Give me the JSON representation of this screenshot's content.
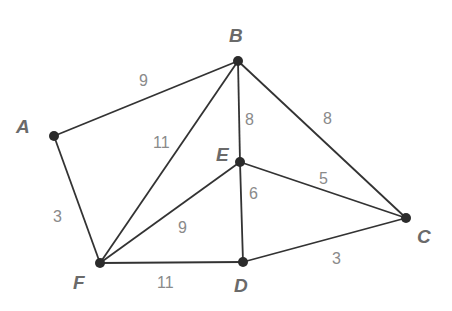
{
  "nodes": [
    {
      "id": "A",
      "label": "A",
      "x": 54,
      "y": 136,
      "lx": 16,
      "ly": 133
    },
    {
      "id": "B",
      "label": "B",
      "x": 238,
      "y": 61,
      "lx": 229,
      "ly": 42
    },
    {
      "id": "C",
      "label": "C",
      "x": 406,
      "y": 218,
      "lx": 417,
      "ly": 243
    },
    {
      "id": "D",
      "label": "D",
      "x": 243,
      "y": 262,
      "lx": 234,
      "ly": 292
    },
    {
      "id": "E",
      "label": "E",
      "x": 240,
      "y": 162,
      "lx": 216,
      "ly": 161
    },
    {
      "id": "F",
      "label": "F",
      "x": 100,
      "y": 263,
      "lx": 73,
      "ly": 289
    }
  ],
  "edges": [
    {
      "from": "A",
      "to": "B",
      "weight": "9",
      "wx": 139,
      "wy": 86
    },
    {
      "from": "A",
      "to": "F",
      "weight": "3",
      "wx": 53,
      "wy": 222
    },
    {
      "from": "F",
      "to": "B",
      "weight": "11",
      "wx": 153,
      "wy": 148
    },
    {
      "from": "B",
      "to": "E",
      "weight": "8",
      "wx": 245,
      "wy": 125
    },
    {
      "from": "B",
      "to": "C",
      "weight": "8",
      "wx": 323,
      "wy": 124
    },
    {
      "from": "E",
      "to": "C",
      "weight": "5",
      "wx": 319,
      "wy": 184
    },
    {
      "from": "E",
      "to": "D",
      "weight": "6",
      "wx": 249,
      "wy": 199
    },
    {
      "from": "F",
      "to": "E",
      "weight": "9",
      "wx": 178,
      "wy": 233
    },
    {
      "from": "F",
      "to": "D",
      "weight": "11",
      "wx": 157,
      "wy": 288
    },
    {
      "from": "D",
      "to": "C",
      "weight": "3",
      "wx": 332,
      "wy": 264
    }
  ]
}
